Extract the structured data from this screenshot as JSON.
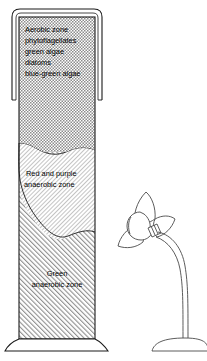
{
  "figure": {
    "name": "winogradsky-column-with-lamp",
    "background_color": "#ffffff",
    "line_color": "#1a1a1a",
    "width": 207,
    "height": 361
  },
  "column": {
    "name": "winogradsky-column",
    "rim_label": "column-rim",
    "base_label": "column-base",
    "zones": [
      {
        "id": "aerobic",
        "fill_pattern": "stipple-checker",
        "fill_color": "#9a9a9a",
        "lines": [
          "Aerobic zone",
          "phytoflagellates",
          "green algae",
          "diatoms",
          "blue-green algae"
        ]
      },
      {
        "id": "red-purple-anaerobic",
        "fill_pattern": "fine-diagonal",
        "fill_color": "#b5b5b5",
        "lines": [
          "Red and purple",
          "anaerobic zone"
        ]
      },
      {
        "id": "green-anaerobic",
        "fill_pattern": "diagonal-hatch",
        "fill_color": "#888888",
        "lines": [
          "Green",
          "anaerobic zone"
        ]
      }
    ]
  },
  "lamp": {
    "name": "desk-lamp",
    "parts": [
      {
        "id": "bulb",
        "label": "light-bulb"
      },
      {
        "id": "shade",
        "label": "reflector-shade"
      },
      {
        "id": "collar",
        "label": "bulb-collar"
      },
      {
        "id": "gooseneck",
        "label": "gooseneck-arm"
      },
      {
        "id": "stem",
        "label": "lamp-stem"
      },
      {
        "id": "base",
        "label": "lamp-base"
      }
    ]
  }
}
